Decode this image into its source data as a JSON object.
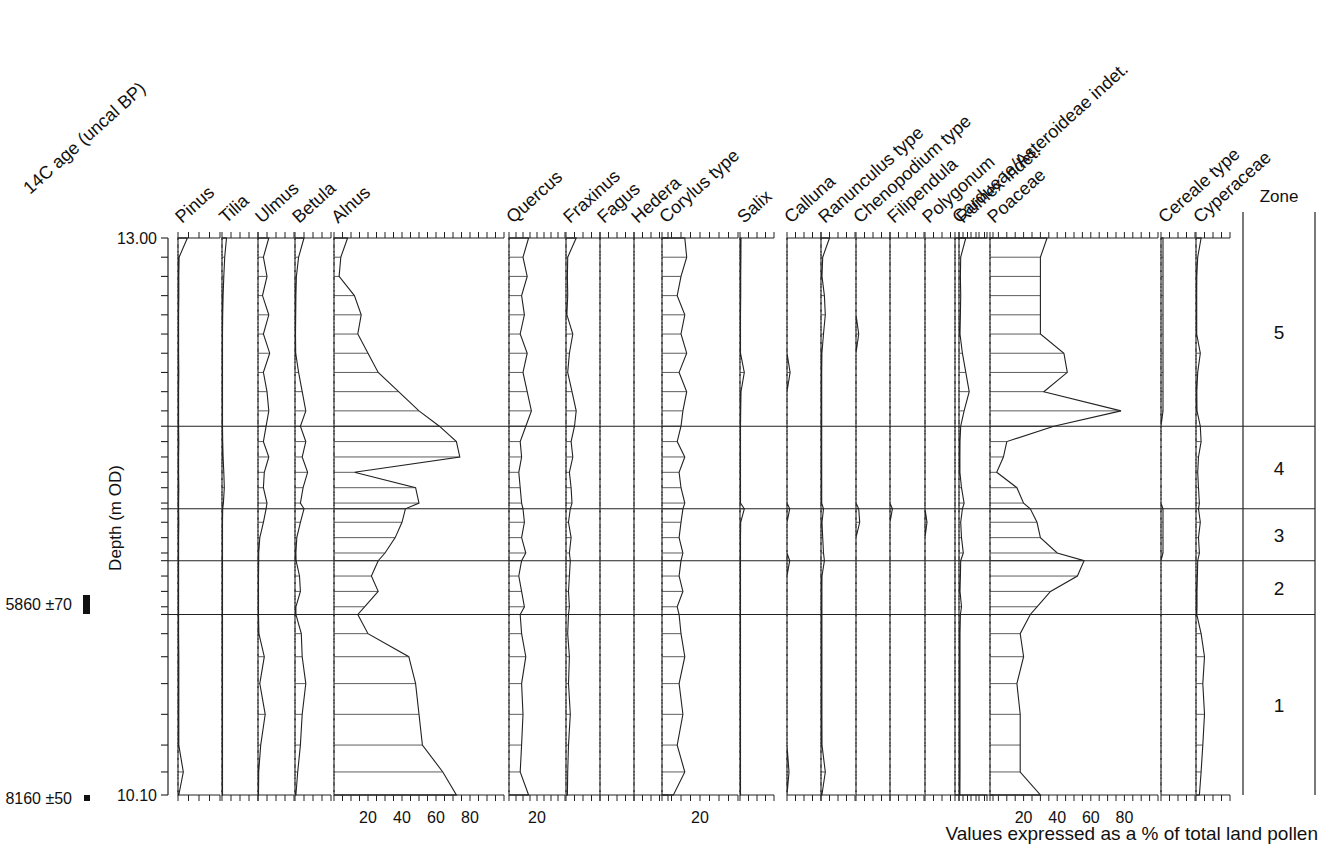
{
  "figure": {
    "title_footer": "Values expressed as a % of total land pollen",
    "y_axis_label": "Depth (m OD)",
    "left_header": "14C age (uncal BP)",
    "zone_header": "Zone",
    "depth_top_label": "13.00",
    "depth_bottom_label": "10.10"
  },
  "c14_dates": [
    {
      "label": "5860 ±70",
      "marker": "thick-bar",
      "depth": 11.3
    },
    {
      "label": "8160 ±50",
      "marker": "small-square",
      "depth": 10.1
    }
  ],
  "zones": [
    {
      "label": "5",
      "top_depth": 13.0,
      "bottom_depth": 12.02
    },
    {
      "label": "4",
      "top_depth": 12.02,
      "bottom_depth": 11.59
    },
    {
      "label": "3",
      "top_depth": 11.59,
      "bottom_depth": 11.32
    },
    {
      "label": "2",
      "top_depth": 11.32,
      "bottom_depth": 11.04
    },
    {
      "label": "1",
      "top_depth": 11.04,
      "bottom_depth": 10.1
    }
  ],
  "chart_data": {
    "type": "area",
    "xlabel": "Values expressed as a % of total land pollen",
    "ylabel": "Depth (m OD)",
    "ylim": [
      10.1,
      13.0
    ],
    "grid": false,
    "legend": "none",
    "depths": [
      13.0,
      12.9,
      12.8,
      12.7,
      12.6,
      12.5,
      12.4,
      12.3,
      12.2,
      12.1,
      12.02,
      11.94,
      11.86,
      11.78,
      11.7,
      11.62,
      11.59,
      11.52,
      11.44,
      11.36,
      11.32,
      11.24,
      11.16,
      11.08,
      11.04,
      10.94,
      10.82,
      10.68,
      10.52,
      10.36,
      10.22,
      10.1
    ],
    "series": [
      {
        "name": "Pinus",
        "axis_max": 20,
        "tick_step": 5,
        "tick_labels": [],
        "values": [
          4.5,
          0.5,
          0.4,
          0.4,
          0.3,
          0.3,
          0.3,
          0.4,
          0.3,
          0.3,
          0.3,
          0.4,
          0.3,
          0.3,
          0.4,
          0.3,
          0.3,
          0.4,
          0.3,
          0.3,
          0.3,
          0.3,
          0.3,
          0.3,
          0.3,
          0.3,
          0.4,
          0.4,
          0.4,
          0.4,
          2.5,
          0.4
        ]
      },
      {
        "name": "Tilia",
        "axis_max": 20,
        "tick_step": 5,
        "tick_labels": [],
        "values": [
          2.5,
          1.5,
          1.0,
          0.6,
          0.4,
          0.3,
          0.3,
          0.3,
          0.3,
          0.3,
          0.3,
          0.4,
          0.6,
          1.0,
          1.3,
          0.8,
          0.4,
          0.3,
          0.3,
          0.3,
          0.3,
          0.3,
          0.3,
          0.3,
          0.3,
          0.3,
          0.3,
          0.3,
          0.3,
          0.3,
          0.3,
          0.3
        ]
      },
      {
        "name": "Ulmus",
        "axis_max": 20,
        "tick_step": 5,
        "tick_labels": [],
        "values": [
          6.0,
          3.0,
          5.0,
          2.5,
          6.0,
          3.0,
          6.5,
          3.0,
          5.0,
          6.0,
          4.5,
          3.0,
          6.0,
          3.5,
          3.0,
          5.0,
          4.5,
          3.0,
          1.0,
          0.4,
          0.4,
          0.3,
          0.3,
          0.3,
          0.3,
          0.5,
          3.5,
          1.0,
          4.0,
          1.5,
          0.4,
          0.3
        ]
      },
      {
        "name": "Betula",
        "axis_max": 20,
        "tick_step": 5,
        "tick_labels": [],
        "values": [
          5.0,
          2.0,
          0.8,
          0.5,
          0.4,
          0.3,
          0.4,
          2.0,
          4.0,
          6.0,
          3.0,
          6.0,
          4.0,
          7.0,
          4.5,
          3.0,
          5.0,
          3.0,
          1.0,
          0.5,
          0.6,
          2.5,
          3.0,
          0.5,
          0.5,
          3.5,
          4.0,
          6.0,
          4.0,
          3.0,
          1.5,
          0.5
        ]
      },
      {
        "name": "Alnus",
        "axis_max": 100,
        "tick_step": 5,
        "tick_labels": [
          20,
          40,
          60,
          80
        ],
        "values": [
          8.0,
          4.0,
          3.0,
          12.0,
          16.0,
          14.0,
          20.0,
          26.0,
          38.0,
          50.0,
          62.0,
          72.0,
          74.0,
          12.0,
          48.0,
          50.0,
          42.0,
          40.0,
          36.0,
          30.0,
          26.0,
          22.0,
          26.0,
          18.0,
          14.0,
          20.0,
          44.0,
          48.0,
          50.0,
          52.0,
          64.0,
          72.0
        ]
      },
      {
        "name": "Quercus",
        "axis_max": 40,
        "tick_step": 5,
        "tick_labels": [
          20
        ],
        "values": [
          14.0,
          10.0,
          13.0,
          9.0,
          11.0,
          8.0,
          13.0,
          10.0,
          13.0,
          16.0,
          12.0,
          8.0,
          9.0,
          7.0,
          8.0,
          9.0,
          10.0,
          11.0,
          9.0,
          12.0,
          9.0,
          7.0,
          9.0,
          11.0,
          8.0,
          9.0,
          12.0,
          9.0,
          10.0,
          9.0,
          8.0,
          14.0
        ]
      },
      {
        "name": "Fraxinus",
        "axis_max": 20,
        "tick_step": 5,
        "tick_labels": [],
        "values": [
          6.0,
          1.0,
          0.8,
          1.0,
          0.5,
          4.0,
          2.0,
          1.0,
          3.5,
          6.0,
          5.0,
          3.0,
          4.0,
          2.0,
          3.0,
          3.5,
          2.5,
          1.5,
          3.0,
          2.0,
          2.5,
          2.0,
          1.5,
          2.0,
          1.5,
          1.0,
          2.0,
          1.5,
          2.5,
          1.5,
          1.0,
          0.8
        ]
      },
      {
        "name": "Fagus",
        "axis_max": 20,
        "tick_step": 5,
        "tick_labels": [],
        "values": [
          0.0,
          0.0,
          0.0,
          0.0,
          0.0,
          0.0,
          0.0,
          0.0,
          0.0,
          0.0,
          0.0,
          0.0,
          0.0,
          0.0,
          0.0,
          0.0,
          0.0,
          0.0,
          0.0,
          0.0,
          0.0,
          0.0,
          0.0,
          0.0,
          0.0,
          0.0,
          0.0,
          0.0,
          0.0,
          0.0,
          0.0,
          0.0
        ]
      },
      {
        "name": "Hedera",
        "axis_max": 20,
        "tick_step": 5,
        "tick_labels": [],
        "values": [
          0.0,
          0.0,
          0.0,
          0.0,
          0.0,
          0.0,
          0.0,
          0.0,
          0.0,
          0.0,
          0.0,
          0.0,
          0.0,
          0.0,
          0.0,
          0.0,
          0.0,
          0.0,
          0.0,
          0.0,
          0.0,
          0.0,
          0.0,
          0.0,
          0.0,
          0.0,
          0.0,
          0.0,
          0.0,
          0.0,
          0.0,
          0.0
        ]
      },
      {
        "name": "Corylus type",
        "axis_max": 40,
        "tick_step": 5,
        "tick_labels": [
          20
        ],
        "values": [
          12.0,
          13.0,
          10.0,
          8.0,
          12.0,
          10.0,
          13.0,
          9.0,
          13.0,
          11.0,
          10.0,
          8.0,
          12.0,
          9.0,
          10.0,
          12.0,
          11.0,
          10.0,
          9.0,
          11.0,
          10.0,
          9.0,
          11.0,
          8.0,
          9.0,
          10.0,
          12.0,
          9.0,
          11.0,
          8.0,
          12.0,
          6.0
        ]
      },
      {
        "name": "Salix",
        "axis_max": 20,
        "tick_step": 5,
        "tick_labels": [],
        "values": [
          0.6,
          0.5,
          0.4,
          0.4,
          0.3,
          0.3,
          0.3,
          2.5,
          0.6,
          0.4,
          0.3,
          0.3,
          0.3,
          0.3,
          0.3,
          0.3,
          2.5,
          0.4,
          0.3,
          0.3,
          0.3,
          0.3,
          0.3,
          0.3,
          0.3,
          0.3,
          0.3,
          0.3,
          0.3,
          0.3,
          0.3,
          0.3
        ]
      },
      {
        "name": "Calluna",
        "axis_max": 20,
        "tick_step": 5,
        "tick_labels": [],
        "values": [
          0.0,
          0.0,
          0.0,
          0.0,
          0.0,
          0.0,
          0.0,
          1.8,
          0.0,
          0.0,
          0.0,
          0.0,
          0.0,
          0.0,
          0.0,
          0.0,
          1.6,
          0.0,
          0.0,
          0.0,
          1.6,
          0.0,
          0.0,
          0.0,
          0.0,
          0.0,
          0.0,
          0.0,
          0.0,
          0.0,
          1.2,
          0.0
        ]
      },
      {
        "name": "Ranunculus type",
        "axis_max": 20,
        "tick_step": 5,
        "tick_labels": [],
        "values": [
          5.0,
          1.0,
          0.6,
          2.0,
          2.5,
          1.5,
          0.5,
          0.4,
          0.4,
          0.4,
          0.4,
          0.4,
          0.4,
          0.4,
          0.4,
          0.4,
          1.5,
          0.6,
          1.0,
          1.5,
          2.0,
          0.6,
          0.5,
          0.5,
          0.5,
          0.5,
          0.5,
          0.5,
          0.5,
          0.6,
          2.5,
          0.5
        ]
      },
      {
        "name": "Chenopodium type",
        "axis_max": 20,
        "tick_step": 5,
        "tick_labels": [],
        "values": [
          0.0,
          0.0,
          0.0,
          0.0,
          0.0,
          1.6,
          0.0,
          0.0,
          0.0,
          0.0,
          0.0,
          0.0,
          0.0,
          0.0,
          0.0,
          0.0,
          1.6,
          2.2,
          0.0,
          0.0,
          0.0,
          0.0,
          0.0,
          0.0,
          0.0,
          0.0,
          0.0,
          0.0,
          0.0,
          0.0,
          0.0,
          0.0
        ]
      },
      {
        "name": "Filipendula",
        "axis_max": 20,
        "tick_step": 5,
        "tick_labels": [],
        "values": [
          0.0,
          0.0,
          0.0,
          0.0,
          0.0,
          0.0,
          0.0,
          0.0,
          0.0,
          0.0,
          0.0,
          0.0,
          0.0,
          0.0,
          0.0,
          0.0,
          1.4,
          0.0,
          0.0,
          0.0,
          0.0,
          0.0,
          0.0,
          0.0,
          0.0,
          0.0,
          0.0,
          0.0,
          0.0,
          0.0,
          0.0,
          0.0
        ]
      },
      {
        "name": "Polygonum",
        "axis_max": 20,
        "tick_step": 5,
        "tick_labels": [],
        "values": [
          0.0,
          0.0,
          0.0,
          0.0,
          0.0,
          0.0,
          0.0,
          0.0,
          0.0,
          0.0,
          0.0,
          0.0,
          0.0,
          0.0,
          0.0,
          0.0,
          0.0,
          1.2,
          0.0,
          0.0,
          0.0,
          0.0,
          0.0,
          0.0,
          0.0,
          0.0,
          0.0,
          0.0,
          0.0,
          0.0,
          0.0,
          0.0
        ]
      },
      {
        "name": "Rumex indet.",
        "axis_max": 20,
        "tick_step": 5,
        "tick_labels": [],
        "values": [
          4.0,
          1.0,
          0.8,
          1.0,
          0.8,
          0.6,
          2.0,
          4.0,
          6.0,
          3.0,
          1.0,
          0.6,
          0.5,
          0.5,
          1.5,
          3.0,
          2.0,
          1.0,
          1.5,
          2.5,
          1.0,
          0.8,
          0.6,
          1.5,
          0.8,
          0.6,
          0.6,
          0.6,
          0.6,
          0.6,
          0.6,
          0.5
        ]
      },
      {
        "name": "Cardueae/Asteroideae indet.",
        "axis_max": 20,
        "tick_step": 5,
        "tick_labels": [],
        "values": [
          0.0,
          0.0,
          0.0,
          0.0,
          0.0,
          0.0,
          0.0,
          0.0,
          0.0,
          0.0,
          0.0,
          0.0,
          0.0,
          0.0,
          0.0,
          0.0,
          0.0,
          0.0,
          0.0,
          0.0,
          0.0,
          0.0,
          0.0,
          0.0,
          0.0,
          0.0,
          0.0,
          0.0,
          0.0,
          0.0,
          0.0,
          0.0
        ]
      },
      {
        "name": "Poaceae",
        "axis_max": 100,
        "tick_step": 5,
        "tick_labels": [
          20,
          40,
          60,
          80
        ],
        "values": [
          34.0,
          30.0,
          30.0,
          30.0,
          30.0,
          30.0,
          44.0,
          46.0,
          32.0,
          78.0,
          38.0,
          10.0,
          8.0,
          4.0,
          16.0,
          20.0,
          24.0,
          28.0,
          30.0,
          40.0,
          56.0,
          52.0,
          36.0,
          28.0,
          24.0,
          18.0,
          20.0,
          16.0,
          18.0,
          18.0,
          18.0,
          30.0
        ]
      },
      {
        "name": "Cereale type",
        "axis_max": 20,
        "tick_step": 5,
        "tick_labels": [],
        "values": [
          1.2,
          1.2,
          1.2,
          1.2,
          1.2,
          1.2,
          1.2,
          1.2,
          1.2,
          1.2,
          0.0,
          0.0,
          0.0,
          0.0,
          0.0,
          0.0,
          1.2,
          1.2,
          1.2,
          1.2,
          0.0,
          0.0,
          0.0,
          0.0,
          0.0,
          0.0,
          0.0,
          0.0,
          0.0,
          0.0,
          0.0,
          0.0
        ]
      },
      {
        "name": "Cyperaceae",
        "axis_max": 20,
        "tick_step": 5,
        "tick_labels": [],
        "values": [
          3.0,
          1.0,
          0.5,
          0.4,
          0.4,
          0.4,
          2.5,
          1.0,
          0.5,
          0.6,
          2.5,
          3.0,
          1.5,
          1.0,
          1.5,
          2.0,
          1.5,
          2.5,
          1.5,
          2.0,
          1.0,
          0.8,
          0.6,
          0.6,
          0.5,
          3.0,
          5.0,
          4.0,
          5.0,
          4.0,
          3.0,
          2.0
        ]
      }
    ]
  }
}
